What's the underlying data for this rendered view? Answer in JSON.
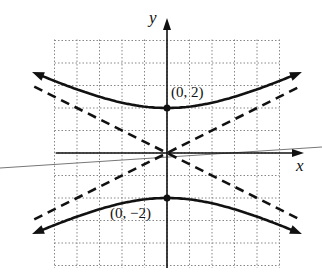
{
  "figure": {
    "type": "hyperbola graph",
    "equation": "y^2/4 - x^2/16 = 1",
    "axes": {
      "x_label": "x",
      "y_label": "y"
    },
    "grid": {
      "x_range": [
        -5,
        5
      ],
      "y_range": [
        -5,
        5
      ],
      "step": 1,
      "style": "dotted"
    },
    "points": [
      {
        "label": "(0, 2)",
        "x": 0,
        "y": 2
      },
      {
        "label": "(0, −2)",
        "x": 0,
        "y": -2
      }
    ],
    "asymptotes": [
      "y = x/2",
      "y = -x/2"
    ],
    "colors": {
      "ink": "#111111",
      "grid": "#888888",
      "stray_line": "#777777"
    }
  }
}
